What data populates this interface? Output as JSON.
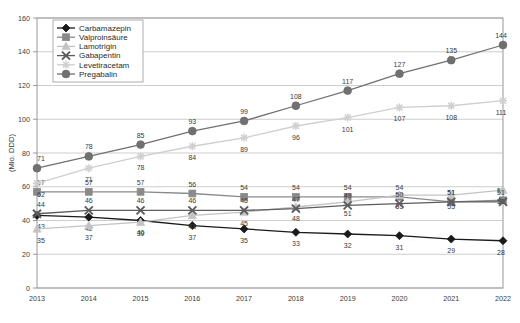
{
  "chart_data": {
    "type": "line",
    "title": "",
    "xlabel": "",
    "ylabel": "(Mio. DDD)",
    "categories": [
      "2013",
      "2014",
      "2015",
      "2016",
      "2017",
      "2018",
      "2019",
      "2020",
      "2021",
      "2022"
    ],
    "ylim": [
      0,
      160
    ],
    "ytick_step": 20,
    "yticks": [
      "0",
      "20",
      "40",
      "60",
      "80",
      "100",
      "120",
      "140",
      "160"
    ],
    "grid": true,
    "legend_position": "top-left",
    "series": [
      {
        "name": "Carbamazepin",
        "marker": "diamond",
        "color": "#1a1a1a",
        "values": [
          43,
          42,
          40,
          37,
          35,
          33,
          32,
          31,
          29,
          28
        ]
      },
      {
        "name": "Valproinsäure",
        "marker": "square",
        "color": "#8a8a8a",
        "values": [
          57,
          57,
          57,
          56,
          54,
          54,
          54,
          54,
          51,
          52
        ]
      },
      {
        "name": "Lamotrigin",
        "marker": "triangle",
        "color": "#c3c3c3",
        "values": [
          35,
          37,
          39,
          43,
          45,
          48,
          51,
          55,
          55,
          58
        ]
      },
      {
        "name": "Gabapentin",
        "marker": "cross",
        "color": "#5c5c5c",
        "values": [
          44,
          46,
          46,
          46,
          46,
          47,
          49,
          50,
          51,
          51
        ]
      },
      {
        "name": "Levetiracetam",
        "marker": "star",
        "color": "#cfcfcf",
        "values": [
          62,
          71,
          78,
          84,
          89,
          96,
          101,
          107,
          108,
          111
        ]
      },
      {
        "name": "Pregabalin",
        "marker": "circle",
        "color": "#707070",
        "values": [
          71,
          78,
          85,
          93,
          99,
          108,
          117,
          127,
          135,
          144
        ]
      }
    ]
  }
}
